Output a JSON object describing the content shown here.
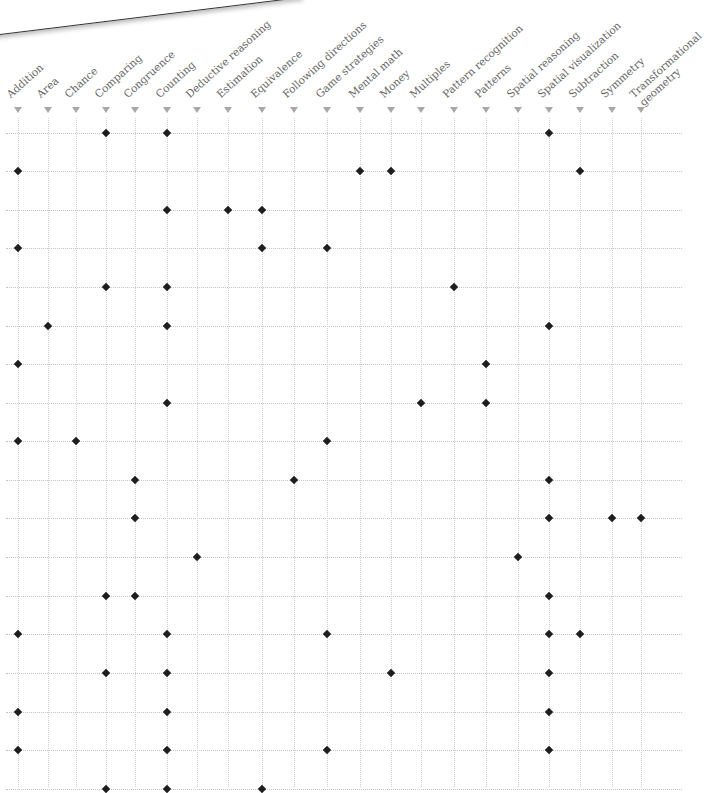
{
  "banner": {
    "text": "to your cu"
  },
  "chart_data": {
    "type": "scatter",
    "title": "",
    "xlabel": "",
    "ylabel": "",
    "grid": true,
    "legend": null,
    "categories": [
      "Addition",
      "Area",
      "Chance",
      "Comparing",
      "Congruence",
      "Counting",
      "Deductive reasoning",
      "Estimation",
      "Equivalence",
      "Following directions",
      "Game strategies",
      "Mental math",
      "Money",
      "Multiples",
      "Pattern recognition",
      "Patterns",
      "Spatial reasoning",
      "Spatial visualization",
      "Subtraction",
      "Symmetry",
      "Transformational geometry"
    ],
    "rows": [
      {
        "row": 1,
        "marks": [
          "Comparing",
          "Counting",
          "Spatial visualization"
        ]
      },
      {
        "row": 2,
        "marks": [
          "Addition",
          "Mental math",
          "Money",
          "Subtraction"
        ]
      },
      {
        "row": 3,
        "marks": [
          "Counting",
          "Estimation",
          "Equivalence"
        ]
      },
      {
        "row": 4,
        "marks": [
          "Addition",
          "Equivalence",
          "Game strategies"
        ]
      },
      {
        "row": 5,
        "marks": [
          "Comparing",
          "Counting",
          "Pattern recognition"
        ]
      },
      {
        "row": 6,
        "marks": [
          "Area",
          "Counting",
          "Spatial visualization"
        ]
      },
      {
        "row": 7,
        "marks": [
          "Addition",
          "Patterns"
        ]
      },
      {
        "row": 8,
        "marks": [
          "Counting",
          "Multiples",
          "Patterns"
        ]
      },
      {
        "row": 9,
        "marks": [
          "Addition",
          "Chance",
          "Game strategies"
        ]
      },
      {
        "row": 10,
        "marks": [
          "Congruence",
          "Following directions",
          "Spatial visualization"
        ]
      },
      {
        "row": 11,
        "marks": [
          "Congruence",
          "Spatial visualization",
          "Symmetry",
          "Transformational geometry"
        ]
      },
      {
        "row": 12,
        "marks": [
          "Deductive reasoning",
          "Spatial reasoning"
        ]
      },
      {
        "row": 13,
        "marks": [
          "Comparing",
          "Congruence",
          "Spatial visualization"
        ]
      },
      {
        "row": 14,
        "marks": [
          "Addition",
          "Counting",
          "Game strategies",
          "Spatial visualization",
          "Subtraction"
        ]
      },
      {
        "row": 15,
        "marks": [
          "Comparing",
          "Counting",
          "Money",
          "Spatial visualization"
        ]
      },
      {
        "row": 16,
        "marks": [
          "Addition",
          "Counting",
          "Spatial visualization"
        ]
      },
      {
        "row": 17,
        "marks": [
          "Addition",
          "Counting",
          "Game strategies",
          "Spatial visualization"
        ]
      },
      {
        "row": 18,
        "marks": [
          "Comparing",
          "Counting",
          "Equivalence"
        ],
        "partially_visible": true
      }
    ]
  },
  "layout": {
    "col_x": [
      18,
      48,
      76,
      106,
      135,
      167,
      197,
      228,
      262,
      294,
      327,
      360,
      391,
      421,
      454,
      486,
      518,
      549,
      580,
      612,
      641
    ],
    "row_y": [
      133,
      171,
      210,
      248,
      287,
      326,
      364,
      403,
      441,
      480,
      518,
      557,
      596,
      634,
      673,
      712,
      750,
      789
    ],
    "label_lines": {
      "Transformational geometry": [
        "Transformational",
        "geometry"
      ]
    }
  },
  "colors": {
    "marker": "#1e1e1e",
    "label": "#666666",
    "arrow": "#a8a8a8",
    "grid": "#c6c6c6"
  }
}
